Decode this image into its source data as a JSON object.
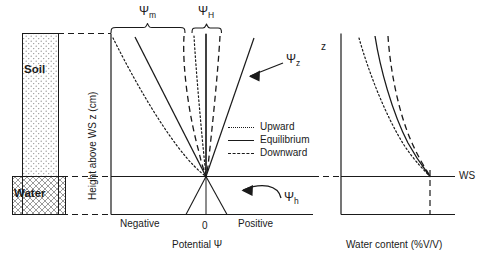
{
  "figure": {
    "title_internal": "Soil water potential and water content profiles above a water surface",
    "domain": "diagram"
  },
  "left_panel": {
    "soil_label": "Soil",
    "water_label": "Water",
    "height_axis_label": "Height above WS z (cm)",
    "soil_fill": "dotted-stipple",
    "water_fill": "cross-hatch"
  },
  "middle_panel": {
    "brace_matric_label": "Ψ",
    "brace_matric_sub": "m",
    "brace_head_label": "Ψ",
    "brace_head_sub": "H",
    "gravitational_label": "Ψ",
    "gravitational_sub": "z",
    "hydrostatic_label": "Ψ",
    "hydrostatic_sub": "h",
    "axis_left_label": "Negative",
    "axis_zero_label": "0",
    "axis_right_label": "Positive",
    "axis_title": "Potential Ψ",
    "legend": [
      {
        "key": "dotted",
        "label": "Upward"
      },
      {
        "key": "solid",
        "label": "Equilibrium"
      },
      {
        "key": "dashed",
        "label": "Downward"
      }
    ]
  },
  "right_panel": {
    "z_axis_label": "z",
    "ws_label": "WS",
    "axis_title": "Water content (%V/V)",
    "curves": [
      {
        "key": "dotted",
        "name": "Upward"
      },
      {
        "key": "solid",
        "name": "Equilibrium"
      },
      {
        "key": "dashed",
        "name": "Downward"
      }
    ]
  },
  "colors": {
    "line": "#1a1a1a",
    "fill_light": "#e8e8e8",
    "background": "#ffffff"
  }
}
